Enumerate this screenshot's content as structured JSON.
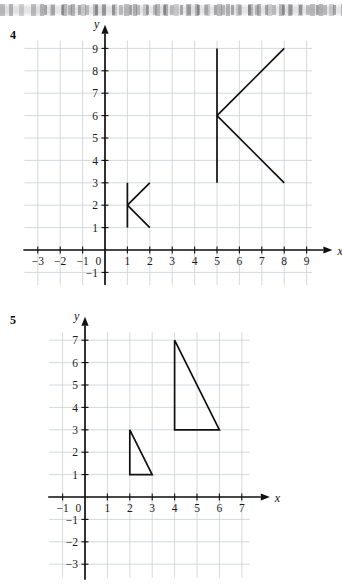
{
  "page": {
    "scan_artifact": "grey-smudge-band"
  },
  "problems": [
    {
      "number": "4",
      "chart_data": {
        "type": "scatter",
        "title": "",
        "xlabel": "x",
        "ylabel": "y",
        "xlim": [
          -3.6,
          9.8
        ],
        "ylim": [
          -1.6,
          9.7
        ],
        "grid": true,
        "legend": "none",
        "x_ticks": [
          -3,
          -2,
          -1,
          0,
          1,
          2,
          3,
          4,
          5,
          6,
          7,
          8,
          9
        ],
        "x_tick_labels": [
          "−3",
          "−2",
          "−1",
          "0",
          "1",
          "2",
          "3",
          "4",
          "5",
          "6",
          "7",
          "8",
          "9"
        ],
        "y_ticks": [
          -1,
          1,
          2,
          3,
          4,
          5,
          6,
          7,
          8,
          9
        ],
        "y_tick_labels": [
          "−1",
          "1",
          "2",
          "3",
          "4",
          "5",
          "6",
          "7",
          "8",
          "9"
        ],
        "origin_label": "0",
        "shapes": [
          {
            "name": "small-k-figure",
            "type": "polyline-group",
            "segments": [
              {
                "name": "spine",
                "points": [
                  [
                    1,
                    1
                  ],
                  [
                    1,
                    3
                  ]
                ]
              },
              {
                "name": "upper-arm",
                "points": [
                  [
                    1,
                    2
                  ],
                  [
                    2,
                    3
                  ]
                ]
              },
              {
                "name": "lower-arm",
                "points": [
                  [
                    1,
                    2
                  ],
                  [
                    2,
                    1
                  ]
                ]
              }
            ]
          },
          {
            "name": "large-k-figure",
            "type": "polyline-group",
            "segments": [
              {
                "name": "spine",
                "points": [
                  [
                    5,
                    3
                  ],
                  [
                    5,
                    9
                  ]
                ]
              },
              {
                "name": "upper-arm",
                "points": [
                  [
                    5,
                    6
                  ],
                  [
                    8,
                    9
                  ]
                ]
              },
              {
                "name": "lower-arm",
                "points": [
                  [
                    5,
                    6
                  ],
                  [
                    8,
                    3
                  ]
                ]
              }
            ]
          }
        ]
      }
    },
    {
      "number": "5",
      "chart_data": {
        "type": "scatter",
        "title": "",
        "xlabel": "x",
        "ylabel": "y",
        "xlim": [
          -1.6,
          7.9
        ],
        "ylim": [
          -3.6,
          7.7
        ],
        "grid": true,
        "legend": "none",
        "x_ticks": [
          -1,
          0,
          1,
          2,
          3,
          4,
          5,
          6,
          7
        ],
        "x_tick_labels": [
          "−1",
          "0",
          "1",
          "2",
          "3",
          "4",
          "5",
          "6",
          "7"
        ],
        "y_ticks": [
          -3,
          -2,
          -1,
          1,
          2,
          3,
          4,
          5,
          6,
          7
        ],
        "y_tick_labels": [
          "−3",
          "−2",
          "−1",
          "1",
          "2",
          "3",
          "4",
          "5",
          "6",
          "7"
        ],
        "origin_label": "0",
        "shapes": [
          {
            "name": "small-triangle",
            "type": "polygon",
            "points": [
              [
                2,
                3
              ],
              [
                2,
                1
              ],
              [
                3,
                1
              ]
            ]
          },
          {
            "name": "large-triangle",
            "type": "polygon",
            "points": [
              [
                4,
                7
              ],
              [
                4,
                3
              ],
              [
                6,
                3
              ]
            ]
          }
        ]
      }
    }
  ],
  "colors": {
    "ink": "#111111",
    "grid": "#c9cfd6",
    "paper": "#ffffff"
  }
}
